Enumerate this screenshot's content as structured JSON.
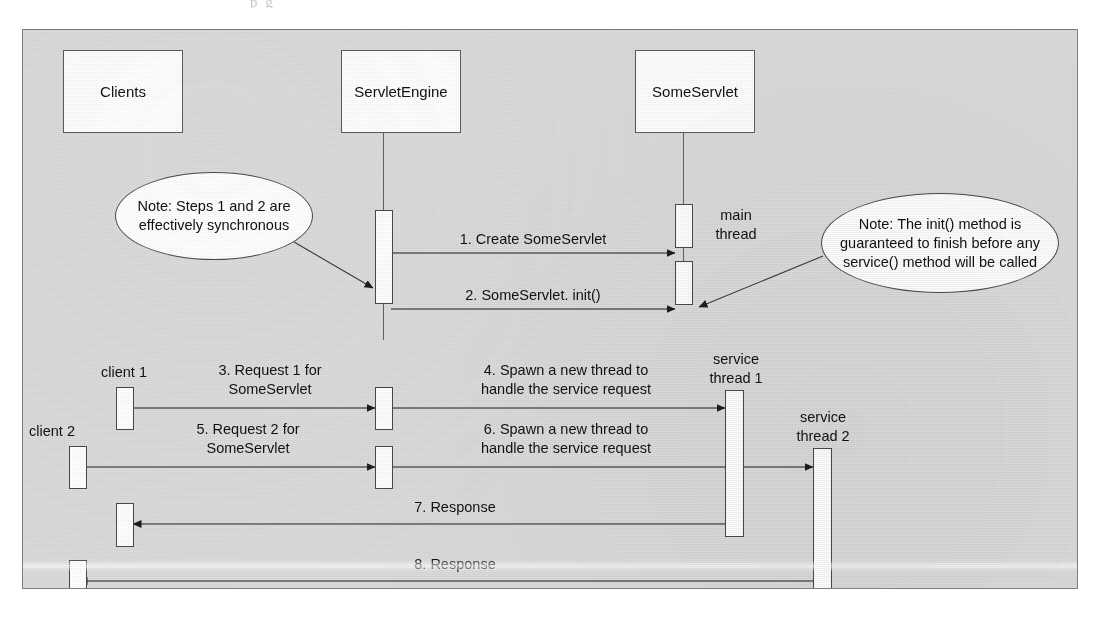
{
  "figure": {
    "background_color": "#dcdcdc",
    "frame_border_color": "#7e7e7e",
    "box_fill": "#ffffff",
    "line_color": "#4a4a4a"
  },
  "page_ghost_text": "p                    g",
  "participants": [
    {
      "id": "clients",
      "label": "Clients"
    },
    {
      "id": "servletengine",
      "label": "ServletEngine"
    },
    {
      "id": "someservlet",
      "label": "SomeServlet"
    }
  ],
  "lifeline_labels": [
    {
      "id": "main-thread",
      "text": "main\nthread"
    },
    {
      "id": "client-1",
      "text": "client 1"
    },
    {
      "id": "client-2",
      "text": "client 2"
    },
    {
      "id": "service-thread-1",
      "text": "service\nthread 1"
    },
    {
      "id": "service-thread-2",
      "text": "service\nthread 2"
    }
  ],
  "messages": [
    {
      "number": "1",
      "text": "1. Create SomeServlet",
      "direction": "right",
      "from": "servletengine",
      "to": "someservlet"
    },
    {
      "number": "2",
      "text": "2. SomeServlet. init()",
      "direction": "right",
      "from": "servletengine",
      "to": "someservlet"
    },
    {
      "number": "3",
      "text": "3. Request 1 for\nSomeServlet",
      "direction": "right",
      "from": "client-1",
      "to": "servletengine"
    },
    {
      "number": "4",
      "text": "4. Spawn a new thread to\nhandle the service request",
      "direction": "right",
      "from": "servletengine",
      "to": "service-thread-1"
    },
    {
      "number": "5",
      "text": "5. Request 2 for\nSomeServlet",
      "direction": "right",
      "from": "client-2",
      "to": "servletengine"
    },
    {
      "number": "6",
      "text": "6. Spawn a new thread to\nhandle the service request",
      "direction": "right",
      "from": "servletengine",
      "to": "service-thread-2"
    },
    {
      "number": "7",
      "text": "7. Response",
      "direction": "left",
      "from": "service-thread-1",
      "to": "client-1"
    },
    {
      "number": "8",
      "text": "8. Response",
      "direction": "left",
      "from": "service-thread-2",
      "to": "client-2"
    }
  ],
  "notes": [
    {
      "id": "note-sync",
      "text": "Note: Steps 1 and 2 are\neffectively synchronous"
    },
    {
      "id": "note-init",
      "text": "Note: The init() method is\nguaranteed to finish before any\nservice() method will be called"
    }
  ]
}
